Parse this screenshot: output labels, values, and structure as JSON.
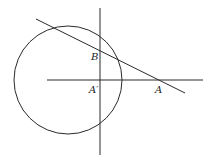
{
  "diagram": {
    "stroke_color": "#2a2a2a",
    "circle": {
      "cx": 68,
      "cy": 80,
      "r": 54
    },
    "vertical_line": {
      "x1": 100,
      "y1": 8,
      "x2": 100,
      "y2": 155
    },
    "horizontal_line": {
      "x1": 47,
      "y1": 80,
      "x2": 203,
      "y2": 80
    },
    "secant_line": {
      "x1": 36,
      "y1": 19,
      "x2": 185,
      "y2": 93
    },
    "labels": {
      "B": "B",
      "A_prime": "A′",
      "A": "A"
    }
  }
}
